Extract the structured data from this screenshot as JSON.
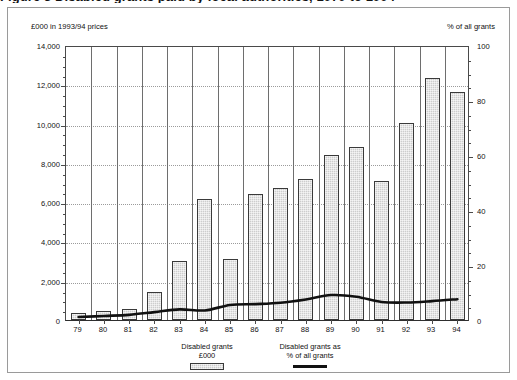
{
  "figure": {
    "clipped_title": "Figure 3  Disabled grants paid by local authorities, 1979 to 1994",
    "left_axis_note": "£000 in 1993/94  prices",
    "right_axis_note": "% of all grants"
  },
  "legend": {
    "items": [
      {
        "line1": "Disabled grants",
        "line2": "£000",
        "swatch": "bar-swatch"
      },
      {
        "line1": "Disabled grants as",
        "line2": "% of all grants",
        "swatch": "line-swatch"
      }
    ]
  },
  "colors": {
    "bar_fill": "#cdcdcd",
    "bar_border": "#3a3a3a",
    "line": "#111111",
    "grid": "#9b9b9b",
    "axis": "#4a4a4a",
    "frame": "#9a9a9a"
  },
  "chart_data": {
    "type": "bar",
    "title": "Disabled grants paid by local authorities, 1979 to 1994",
    "xlabel": "",
    "ylabel": "£000 in 1993/94  prices",
    "y2label": "% of all grants",
    "categories": [
      "79",
      "80",
      "81",
      "82",
      "83",
      "84",
      "85",
      "86",
      "87",
      "88",
      "89",
      "90",
      "91",
      "92",
      "93",
      "94"
    ],
    "ylim": [
      0,
      14000
    ],
    "yticks": [
      0,
      2000,
      4000,
      6000,
      8000,
      10000,
      12000,
      14000
    ],
    "ytick_labels": [
      "0",
      "2,000",
      "4,000",
      "6,000",
      "8,000",
      "10,000",
      "12,000",
      "14,000"
    ],
    "y2lim": [
      0,
      100
    ],
    "y2ticks": [
      0,
      20,
      40,
      60,
      80,
      100
    ],
    "y2tick_labels": [
      "0",
      "20",
      "40",
      "60",
      "80",
      "100"
    ],
    "minor_tick_interval": 500,
    "grid": true,
    "legend_position": "bottom-center",
    "series": [
      {
        "name": "Disabled grants £000",
        "type": "bar",
        "axis": "left",
        "values": [
          350,
          450,
          550,
          1450,
          3000,
          6150,
          3100,
          6400,
          6700,
          7200,
          8400,
          8800,
          7100,
          10050,
          12300,
          11600
        ]
      },
      {
        "name": "Disabled grants as % of all grants",
        "type": "line",
        "axis": "right",
        "values": [
          1.8,
          2.2,
          2.6,
          3.6,
          4.6,
          4.2,
          6.2,
          6.5,
          7.0,
          8.2,
          9.8,
          9.2,
          7.3,
          7.1,
          7.6,
          8.3
        ]
      }
    ]
  }
}
